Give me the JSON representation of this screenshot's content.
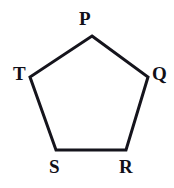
{
  "figure": {
    "kind": "geometry-diagram",
    "shape_name": "pentagon",
    "background_color": "#ffffff",
    "stroke_color": "#15141c",
    "stroke_width": 3,
    "fill_color": "none",
    "canvas": {
      "width": 174,
      "height": 188
    },
    "vertices": [
      {
        "id": "P",
        "label": "P",
        "x": 92,
        "y": 36,
        "label_x": 79,
        "label_y": 9,
        "position": "top"
      },
      {
        "id": "Q",
        "label": "Q",
        "x": 148,
        "y": 77,
        "label_x": 152,
        "label_y": 64,
        "position": "right"
      },
      {
        "id": "R",
        "label": "R",
        "x": 126,
        "y": 150,
        "label_x": 119,
        "label_y": 157,
        "position": "bottom-right"
      },
      {
        "id": "S",
        "label": "S",
        "x": 56,
        "y": 150,
        "label_x": 49,
        "label_y": 157,
        "position": "bottom-left"
      },
      {
        "id": "T",
        "label": "T",
        "x": 30,
        "y": 77,
        "label_x": 13,
        "label_y": 64,
        "position": "left"
      }
    ],
    "edges": [
      {
        "id": "PQ",
        "from": "P",
        "to": "Q"
      },
      {
        "id": "QR",
        "from": "Q",
        "to": "R"
      },
      {
        "id": "RS",
        "from": "R",
        "to": "S"
      },
      {
        "id": "ST",
        "from": "S",
        "to": "T"
      },
      {
        "id": "TP",
        "from": "T",
        "to": "P"
      }
    ],
    "polygon_points": "92,36 148,77 126,150 56,150 30,77"
  }
}
